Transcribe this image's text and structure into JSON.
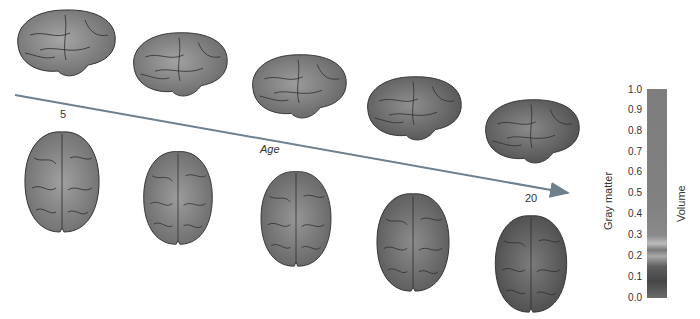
{
  "diagram": {
    "arrow": {
      "label": "Age",
      "start_label": "5",
      "end_label": "20",
      "color": "#6e7f8e"
    },
    "lateral_views": [
      {
        "name": "brain-lateral-1",
        "shade": "#8c8c8c"
      },
      {
        "name": "brain-lateral-2",
        "shade": "#888888"
      },
      {
        "name": "brain-lateral-3",
        "shade": "#858585"
      },
      {
        "name": "brain-lateral-4",
        "shade": "#6f6f6f"
      },
      {
        "name": "brain-lateral-5",
        "shade": "#6a6a6a"
      }
    ],
    "top_views": [
      {
        "name": "brain-top-1",
        "shade": "#8a8a8a"
      },
      {
        "name": "brain-top-2",
        "shade": "#858585"
      },
      {
        "name": "brain-top-3",
        "shade": "#7f7f7f"
      },
      {
        "name": "brain-top-4",
        "shade": "#727272"
      },
      {
        "name": "brain-top-5",
        "shade": "#606060"
      }
    ],
    "colorbar": {
      "label_left": "Gray matter",
      "label_right": "Volume",
      "ticks": [
        "1.0",
        "0.9",
        "0.8",
        "0.7",
        "0.6",
        "0.5",
        "0.4",
        "0.3",
        "0.2",
        "0.1",
        "0.0"
      ]
    }
  }
}
